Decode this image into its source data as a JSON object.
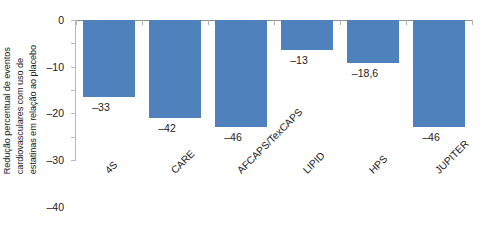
{
  "chart_data": {
    "type": "bar",
    "title": "",
    "subtitle": "",
    "xlabel": "",
    "ylabel": "Redução percentual de eventos cardiovasculares com uso de estatinas em relação ao placebo",
    "ylabel_lines": [
      "Redução percentual de eventos",
      "cardiovasculares com uso de",
      "estatinas em relação ao placebo"
    ],
    "categories": [
      "4S",
      "CARE",
      "AFCAPS/TexCAPS",
      "LIPID",
      "HPS",
      "JUPITER"
    ],
    "values": [
      -33,
      -42,
      -46,
      -13,
      -18.6,
      -46
    ],
    "value_labels": [
      "–33",
      "–42",
      "–46",
      "–13",
      "–18,6",
      "–46"
    ],
    "ylim": [
      -60,
      0
    ],
    "yticks": [
      0,
      -10,
      -20,
      -30,
      -40,
      -50,
      -60
    ],
    "ytick_labels": [
      "0",
      "–10",
      "–20",
      "–30",
      "–40",
      "–50",
      "–60"
    ],
    "grid": false,
    "legend": false,
    "legend_position": "none",
    "bar_color": "#4f81bd",
    "axis_color": "#b8b8b8",
    "text_color": "#1a1a1a",
    "xtick_label_rotation": 45
  }
}
